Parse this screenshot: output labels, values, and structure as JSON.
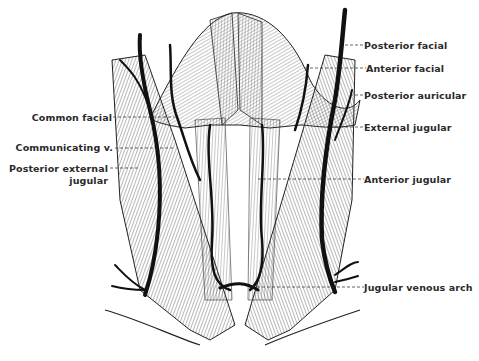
{
  "figure": {
    "colors": {
      "vein": "#111111",
      "muscle_line": "#333333",
      "background": "#ffffff",
      "label": "#2a2a2a"
    },
    "labels_left": [
      {
        "id": "common-facial",
        "text": "Common facial"
      },
      {
        "id": "communicating-v",
        "text": "Communicating v."
      },
      {
        "id": "posterior-external-jugular-1",
        "text": "Posterior external"
      },
      {
        "id": "posterior-external-jugular-2",
        "text": "jugular"
      }
    ],
    "labels_right": [
      {
        "id": "posterior-facial",
        "text": "Posterior facial"
      },
      {
        "id": "anterior-facial",
        "text": "Anterior facial"
      },
      {
        "id": "posterior-auricular",
        "text": "Posterior auricular"
      },
      {
        "id": "external-jugular",
        "text": "External jugular"
      },
      {
        "id": "anterior-jugular",
        "text": "Anterior jugular"
      },
      {
        "id": "jugular-venous-arch",
        "text": "Jugular venous arch"
      }
    ],
    "caption": ""
  }
}
